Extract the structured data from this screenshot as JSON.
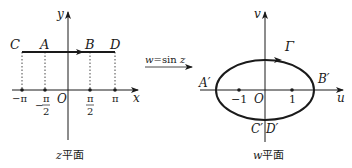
{
  "left_panel": {
    "axis_x_label": "x",
    "axis_y_label": "y",
    "origin_label": "O",
    "points": [
      {
        "label": "C",
        "tick": "−π"
      },
      {
        "label": "A",
        "tick": "−π/2"
      },
      {
        "label": "B",
        "tick": "π/2"
      },
      {
        "label": "D",
        "tick": "π"
      }
    ],
    "ticks": {
      "neg_pi": "−π",
      "neg_half_pi_sign": "−",
      "half_pi_num": "π",
      "half_pi_den": "2",
      "pi": "π"
    },
    "caption_var": "z",
    "caption_text": "平面"
  },
  "mapping": {
    "label_var": "w",
    "label_eq": "=sin ",
    "label_arg": "z"
  },
  "right_panel": {
    "axis_u_label": "u",
    "axis_v_label": "v",
    "origin_label": "O",
    "curve_label": "Γ",
    "points": {
      "a": "A′",
      "b": "B′",
      "c": "C′",
      "d": "D′"
    },
    "ticks": {
      "neg_one": "−1",
      "one": "1"
    },
    "caption_var": "w",
    "caption_text": "平面"
  }
}
